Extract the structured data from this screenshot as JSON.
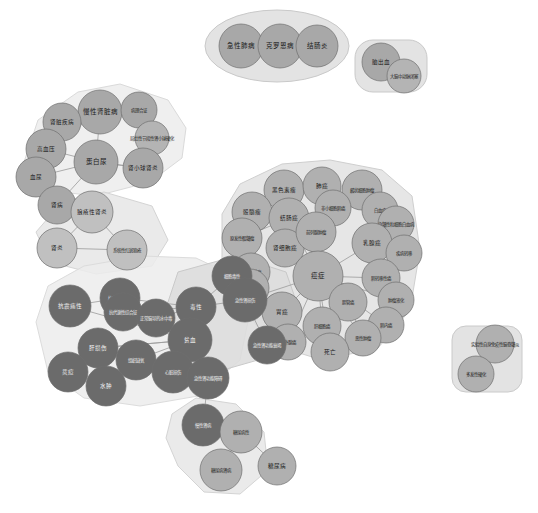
{
  "view": {
    "title": "疾病关联知识图谱",
    "width": 538,
    "height": 513,
    "background": "#ffffff"
  },
  "palette": {
    "node_grey": "#a8a8a8",
    "node_dark": "#6b6b6b",
    "node_light": "#c4c4c4",
    "hull_grey": "#e2e2e2",
    "hull_light": "#eeeeee",
    "hull_mid": "#d8d8d8",
    "edge": "#9a9a9a",
    "node_stroke": "#6e6e6e",
    "label_dark": "#1a1a1a",
    "label_light": "#f2f2f2"
  },
  "clusters": [
    {
      "id": "cluster-respiratory",
      "name": "呼吸系统簇",
      "fill": "#dedede",
      "stroke": "#c9c9c9",
      "shape": "ellipse",
      "cx": 277,
      "cy": 46,
      "rx": 72,
      "ry": 36
    },
    {
      "id": "cluster-stroke",
      "name": "脑血管簇",
      "fill": "#dedede",
      "stroke": "#c9c9c9",
      "shape": "rounded",
      "x": 355,
      "y": 40,
      "w": 72,
      "h": 52,
      "r": 18
    },
    {
      "id": "cluster-renal",
      "name": "肾脏疾病簇",
      "fill": "#ececec",
      "stroke": "#dadada",
      "shape": "polygon",
      "points": "22,168 38,120 78,92 120,84 168,100 186,128 182,158 150,182 96,196 44,190"
    },
    {
      "id": "cluster-lupus",
      "name": "狼疮簇",
      "fill": "#e6e6e6",
      "stroke": "#d4d4d4",
      "shape": "polygon",
      "points": "36,232 62,202 104,192 152,206 168,240 152,266 96,274 50,262"
    },
    {
      "id": "cluster-oncology",
      "name": "肿瘤簇",
      "fill": "#e2e2e2",
      "stroke": "#cfcfcf",
      "shape": "polygon",
      "points": "222,214 240,184 282,164 330,160 382,170 412,196 420,250 410,310 378,348 322,360 270,344 238,300 222,258"
    },
    {
      "id": "cluster-toxicity",
      "name": "毒性与贫血簇",
      "fill": "#ececec",
      "stroke": "#dcdcdc",
      "shape": "polygon",
      "points": "36,322 48,286 84,266 142,256 196,258 234,276 250,312 240,360 198,396 140,406 84,398 48,372"
    },
    {
      "id": "cluster-aki",
      "name": "急性肾损伤簇",
      "fill": "#dcdcdc",
      "stroke": "#c9c9c9",
      "shape": "polygon",
      "points": "178,272 236,256 286,272 300,312 272,356 216,372 180,348 166,308"
    },
    {
      "id": "cluster-diabetes",
      "name": "糖尿病簇",
      "fill": "#e6e6e6",
      "stroke": "#d4d4d4",
      "shape": "polygon",
      "points": "172,414 196,398 236,404 264,432 268,470 240,494 204,492 178,466 166,438"
    },
    {
      "id": "cluster-ms",
      "name": "多发性硬化簇",
      "fill": "#dedede",
      "stroke": "#cacaca",
      "shape": "rounded",
      "x": 452,
      "y": 326,
      "w": 70,
      "h": 66,
      "r": 14
    }
  ],
  "nodes": [
    {
      "id": "n1",
      "label": "急性肺病",
      "x": 241,
      "y": 46,
      "r": 22,
      "color": "#a8a8a8",
      "size": "md"
    },
    {
      "id": "n2",
      "label": "克罗恩病",
      "x": 280,
      "y": 46,
      "r": 22,
      "color": "#a8a8a8",
      "size": "md"
    },
    {
      "id": "n3",
      "label": "结肠炎",
      "x": 317,
      "y": 46,
      "r": 21,
      "color": "#a8a8a8",
      "size": "md"
    },
    {
      "id": "n4",
      "label": "脑出血",
      "x": 381,
      "y": 62,
      "r": 19,
      "color": "#a8a8a8",
      "size": "sm"
    },
    {
      "id": "n5",
      "label": "大脑中动脉闭塞",
      "x": 404,
      "y": 76,
      "r": 17,
      "color": "#b4b4b4",
      "size": "xs"
    },
    {
      "id": "n6",
      "label": "慢性肾脏病",
      "x": 100,
      "y": 112,
      "r": 22,
      "color": "#a8a8a8",
      "size": "md"
    },
    {
      "id": "n7",
      "label": "肾脏疾病",
      "x": 62,
      "y": 122,
      "r": 19,
      "color": "#a8a8a8",
      "size": "sm"
    },
    {
      "id": "n8",
      "label": "病理合证",
      "x": 139,
      "y": 110,
      "r": 18,
      "color": "#a8a8a8",
      "size": "xs"
    },
    {
      "id": "n9",
      "label": "局灶性节段性肾小球硬化",
      "x": 152,
      "y": 138,
      "r": 17,
      "color": "#b4b4b4",
      "size": "xs"
    },
    {
      "id": "n10",
      "label": "高血压",
      "x": 46,
      "y": 149,
      "r": 20,
      "color": "#a8a8a8",
      "size": "sm"
    },
    {
      "id": "n11",
      "label": "肾小球肾炎",
      "x": 143,
      "y": 168,
      "r": 20,
      "color": "#a8a8a8",
      "size": "sm"
    },
    {
      "id": "n12",
      "label": "蛋白尿",
      "x": 96,
      "y": 162,
      "r": 22,
      "color": "#a8a8a8",
      "size": "md"
    },
    {
      "id": "n13",
      "label": "血尿",
      "x": 36,
      "y": 177,
      "r": 20,
      "color": "#a8a8a8",
      "size": "sm"
    },
    {
      "id": "n14",
      "label": "肾病",
      "x": 57,
      "y": 205,
      "r": 19,
      "color": "#a8a8a8",
      "size": "sm"
    },
    {
      "id": "n15",
      "label": "狼疮性肾炎",
      "x": 92,
      "y": 212,
      "r": 21,
      "color": "#c0c0c0",
      "size": "sm"
    },
    {
      "id": "n16",
      "label": "肾炎",
      "x": 57,
      "y": 248,
      "r": 20,
      "color": "#c0c0c0",
      "size": "sm"
    },
    {
      "id": "n17",
      "label": "系统性红斑狼疮",
      "x": 127,
      "y": 250,
      "r": 20,
      "color": "#c0c0c0",
      "size": "xs"
    },
    {
      "id": "n18",
      "label": "黑色素瘤",
      "x": 284,
      "y": 190,
      "r": 20,
      "color": "#b0b0b0",
      "size": "sm"
    },
    {
      "id": "n19",
      "label": "肺癌",
      "x": 322,
      "y": 186,
      "r": 19,
      "color": "#b0b0b0",
      "size": "sm"
    },
    {
      "id": "n20",
      "label": "麟状细胞肿瘤",
      "x": 362,
      "y": 190,
      "r": 20,
      "color": "#b0b0b0",
      "size": "xs"
    },
    {
      "id": "n21",
      "label": "骰髓瘤",
      "x": 252,
      "y": 212,
      "r": 20,
      "color": "#b0b0b0",
      "size": "sm"
    },
    {
      "id": "n22",
      "label": "结肠癌",
      "x": 289,
      "y": 218,
      "r": 20,
      "color": "#b0b0b0",
      "size": "sm"
    },
    {
      "id": "n23",
      "label": "非小细胞肺癌",
      "x": 333,
      "y": 208,
      "r": 18,
      "color": "#b0b0b0",
      "size": "xs"
    },
    {
      "id": "n24",
      "label": "白血病",
      "x": 380,
      "y": 210,
      "r": 18,
      "color": "#b0b0b0",
      "size": "xs"
    },
    {
      "id": "n25",
      "label": "急髓性粒细胞白血病",
      "x": 396,
      "y": 224,
      "r": 18,
      "color": "#b0b0b0",
      "size": "xs"
    },
    {
      "id": "n26",
      "label": "原发性骰髓瘤",
      "x": 242,
      "y": 238,
      "r": 20,
      "color": "#b0b0b0",
      "size": "xs"
    },
    {
      "id": "n27",
      "label": "肾细胞癌",
      "x": 285,
      "y": 248,
      "r": 19,
      "color": "#b0b0b0",
      "size": "sm"
    },
    {
      "id": "n28",
      "label": "乳腺癌",
      "x": 372,
      "y": 243,
      "r": 20,
      "color": "#b0b0b0",
      "size": "sm"
    },
    {
      "id": "n29",
      "label": "疾病转移",
      "x": 404,
      "y": 253,
      "r": 18,
      "color": "#b0b0b0",
      "size": "xs"
    },
    {
      "id": "n30",
      "label": "神经胶质瘤",
      "x": 251,
      "y": 272,
      "r": 19,
      "color": "#b0b0b0",
      "size": "xs"
    },
    {
      "id": "n31",
      "label": "前列腺肿瘤",
      "x": 316,
      "y": 232,
      "r": 20,
      "color": "#b0b0b0",
      "size": "xs"
    },
    {
      "id": "n32",
      "label": "癌症",
      "x": 318,
      "y": 276,
      "r": 25,
      "color": "#b0b0b0",
      "size": "md"
    },
    {
      "id": "n33",
      "label": "肿瘤负荷",
      "x": 250,
      "y": 288,
      "r": 19,
      "color": "#b0b0b0",
      "size": "xs"
    },
    {
      "id": "n34",
      "label": "肺转移性癌",
      "x": 381,
      "y": 278,
      "r": 19,
      "color": "#b0b0b0",
      "size": "xs"
    },
    {
      "id": "n35",
      "label": "肿瘤液化",
      "x": 396,
      "y": 300,
      "r": 18,
      "color": "#b0b0b0",
      "size": "xs"
    },
    {
      "id": "n36",
      "label": "胃癌",
      "x": 282,
      "y": 312,
      "r": 20,
      "color": "#b0b0b0",
      "size": "sm"
    },
    {
      "id": "n37",
      "label": "胆管癌",
      "x": 348,
      "y": 302,
      "r": 19,
      "color": "#b0b0b0",
      "size": "xs"
    },
    {
      "id": "n38",
      "label": "肺内癌",
      "x": 386,
      "y": 325,
      "r": 18,
      "color": "#b0b0b0",
      "size": "xs"
    },
    {
      "id": "n39",
      "label": "肝细胞癌",
      "x": 322,
      "y": 326,
      "r": 19,
      "color": "#b0b0b0",
      "size": "xs"
    },
    {
      "id": "n40",
      "label": "恶性肿瘤",
      "x": 363,
      "y": 338,
      "r": 18,
      "color": "#b0b0b0",
      "size": "xs"
    },
    {
      "id": "n41",
      "label": "肾外腺癌",
      "x": 288,
      "y": 342,
      "r": 18,
      "color": "#b0b0b0",
      "size": "xs"
    },
    {
      "id": "n42",
      "label": "死亡",
      "x": 330,
      "y": 352,
      "r": 19,
      "color": "#b0b0b0",
      "size": "sm"
    },
    {
      "id": "n43",
      "label": "抗肿瘤性改变",
      "x": 120,
      "y": 298,
      "r": 20,
      "color": "#6b6b6b",
      "size": "xs"
    },
    {
      "id": "n44",
      "label": "抗震痛性",
      "x": 70,
      "y": 306,
      "r": 21,
      "color": "#6b6b6b",
      "size": "sm"
    },
    {
      "id": "n45",
      "label": "抗代谢性综合征",
      "x": 123,
      "y": 312,
      "r": 19,
      "color": "#6b6b6b",
      "size": "xs"
    },
    {
      "id": "n46",
      "label": "正常脑导的水中毒",
      "x": 156,
      "y": 318,
      "r": 19,
      "color": "#6b6b6b",
      "size": "xs"
    },
    {
      "id": "n47",
      "label": "毒性",
      "x": 196,
      "y": 307,
      "r": 20,
      "color": "#6b6b6b",
      "size": "sm"
    },
    {
      "id": "n48",
      "label": "细胞毒性",
      "x": 232,
      "y": 276,
      "r": 20,
      "color": "#6b6b6b",
      "size": "xs"
    },
    {
      "id": "n49",
      "label": "急性肾损伤",
      "x": 245,
      "y": 300,
      "r": 22,
      "color": "#6b6b6b",
      "size": "xs"
    },
    {
      "id": "n50",
      "label": "贫血",
      "x": 190,
      "y": 340,
      "r": 22,
      "color": "#6b6b6b",
      "size": "sm"
    },
    {
      "id": "n51",
      "label": "急性肾功能衰竭",
      "x": 267,
      "y": 345,
      "r": 19,
      "color": "#6b6b6b",
      "size": "xs"
    },
    {
      "id": "n52",
      "label": "肝损伤",
      "x": 98,
      "y": 348,
      "r": 20,
      "color": "#6b6b6b",
      "size": "sm"
    },
    {
      "id": "n53",
      "label": "组织缺氧",
      "x": 136,
      "y": 360,
      "r": 20,
      "color": "#6b6b6b",
      "size": "xs"
    },
    {
      "id": "n54",
      "label": "烎痘",
      "x": 68,
      "y": 372,
      "r": 20,
      "color": "#6b6b6b",
      "size": "sm"
    },
    {
      "id": "n55",
      "label": "心脏损伤",
      "x": 173,
      "y": 372,
      "r": 21,
      "color": "#6b6b6b",
      "size": "xs"
    },
    {
      "id": "n56",
      "label": "急性肾功能障碍",
      "x": 208,
      "y": 378,
      "r": 21,
      "color": "#6b6b6b",
      "size": "xs"
    },
    {
      "id": "n57",
      "label": "水肿",
      "x": 106,
      "y": 386,
      "r": 20,
      "color": "#6b6b6b",
      "size": "sm"
    },
    {
      "id": "n58",
      "label": "慢性肾病",
      "x": 203,
      "y": 425,
      "r": 21,
      "color": "#6b6b6b",
      "size": "xs"
    },
    {
      "id": "n59",
      "label": "糖尿病性",
      "x": 241,
      "y": 432,
      "r": 21,
      "color": "#b0b0b0",
      "size": "xs"
    },
    {
      "id": "n60",
      "label": "糖尿病肾病",
      "x": 221,
      "y": 470,
      "r": 21,
      "color": "#b0b0b0",
      "size": "xs"
    },
    {
      "id": "n61",
      "label": "糖尿病",
      "x": 277,
      "y": 466,
      "r": 19,
      "color": "#b0b0b0",
      "size": "sm"
    },
    {
      "id": "n62",
      "label": "实验性自身免疫性脑脊髓炎",
      "x": 495,
      "y": 344,
      "r": 19,
      "color": "#b0b0b0",
      "size": "xs"
    },
    {
      "id": "n63",
      "label": "多发性硬化",
      "x": 476,
      "y": 374,
      "r": 18,
      "color": "#b0b0b0",
      "size": "xs"
    }
  ],
  "edges": [
    [
      "n1",
      "n2"
    ],
    [
      "n2",
      "n3"
    ],
    [
      "n4",
      "n5"
    ],
    [
      "n6",
      "n7"
    ],
    [
      "n6",
      "n8"
    ],
    [
      "n6",
      "n12"
    ],
    [
      "n6",
      "n10"
    ],
    [
      "n8",
      "n9"
    ],
    [
      "n9",
      "n11"
    ],
    [
      "n11",
      "n12"
    ],
    [
      "n10",
      "n12"
    ],
    [
      "n10",
      "n13"
    ],
    [
      "n12",
      "n13"
    ],
    [
      "n12",
      "n14"
    ],
    [
      "n13",
      "n14"
    ],
    [
      "n12",
      "n11"
    ],
    [
      "n14",
      "n15"
    ],
    [
      "n15",
      "n17"
    ],
    [
      "n16",
      "n17"
    ],
    [
      "n15",
      "n16"
    ],
    [
      "n18",
      "n21"
    ],
    [
      "n19",
      "n23"
    ],
    [
      "n20",
      "n23"
    ],
    [
      "n21",
      "n22"
    ],
    [
      "n22",
      "n26"
    ],
    [
      "n24",
      "n25"
    ],
    [
      "n26",
      "n30"
    ],
    [
      "n27",
      "n32"
    ],
    [
      "n28",
      "n29"
    ],
    [
      "n31",
      "n32"
    ],
    [
      "n32",
      "n19"
    ],
    [
      "n32",
      "n22"
    ],
    [
      "n32",
      "n28"
    ],
    [
      "n32",
      "n34"
    ],
    [
      "n32",
      "n36"
    ],
    [
      "n32",
      "n37"
    ],
    [
      "n32",
      "n39"
    ],
    [
      "n32",
      "n42"
    ],
    [
      "n32",
      "n27"
    ],
    [
      "n32",
      "n31"
    ],
    [
      "n32",
      "n35"
    ],
    [
      "n32",
      "n40"
    ],
    [
      "n32",
      "n41"
    ],
    [
      "n32",
      "n38"
    ],
    [
      "n36",
      "n41"
    ],
    [
      "n39",
      "n42"
    ],
    [
      "n37",
      "n40"
    ],
    [
      "n43",
      "n45"
    ],
    [
      "n44",
      "n43"
    ],
    [
      "n45",
      "n46"
    ],
    [
      "n46",
      "n47"
    ],
    [
      "n47",
      "n48"
    ],
    [
      "n47",
      "n50"
    ],
    [
      "n48",
      "n49"
    ],
    [
      "n49",
      "n51"
    ],
    [
      "n50",
      "n43"
    ],
    [
      "n50",
      "n45"
    ],
    [
      "n50",
      "n53"
    ],
    [
      "n50",
      "n55"
    ],
    [
      "n50",
      "n52"
    ],
    [
      "n52",
      "n54"
    ],
    [
      "n53",
      "n57"
    ],
    [
      "n55",
      "n56"
    ],
    [
      "n56",
      "n58"
    ],
    [
      "n58",
      "n59"
    ],
    [
      "n59",
      "n60"
    ],
    [
      "n59",
      "n61"
    ],
    [
      "n50",
      "n56"
    ],
    [
      "n47",
      "n49"
    ],
    [
      "n49",
      "n32"
    ],
    [
      "n44",
      "n50"
    ],
    [
      "n45",
      "n47"
    ],
    [
      "n43",
      "n47"
    ],
    [
      "n46",
      "n50"
    ],
    [
      "n52",
      "n50"
    ]
  ]
}
